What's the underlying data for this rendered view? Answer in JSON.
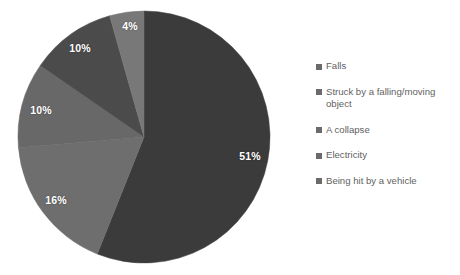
{
  "chart_data": {
    "type": "pie",
    "title": "",
    "subtitle": "",
    "xlabel": "",
    "ylabel": "",
    "grid": false,
    "legend_position": "right",
    "start_angle_deg": 0,
    "direction": "clockwise",
    "categories": [
      "Falls",
      "Struck by a falling/moving object",
      "A collapse",
      "Electricity",
      "Being hit by a vehicle"
    ],
    "values": [
      51,
      16,
      10,
      10,
      4
    ],
    "data_labels": [
      "51%",
      "16%",
      "10%",
      "10%",
      "4%"
    ],
    "slice_colors": [
      "#3b3b3b",
      "#6e6e6e",
      "#686868",
      "#4b4b4b",
      "#787878"
    ],
    "slices": [
      {
        "label": "Falls",
        "value": 51,
        "data_label": "51%",
        "color": "#3b3b3b",
        "label_x": 250,
        "label_y": 156
      },
      {
        "label": "Struck by a falling/moving object",
        "value": 16,
        "data_label": "16%",
        "color": "#6e6e6e",
        "label_x": 56,
        "label_y": 200
      },
      {
        "label": "A collapse",
        "value": 10,
        "data_label": "10%",
        "color": "#686868",
        "label_x": 41,
        "label_y": 110
      },
      {
        "label": "Electricity",
        "value": 10,
        "data_label": "10%",
        "color": "#4b4b4b",
        "label_x": 80,
        "label_y": 48
      },
      {
        "label": "Being hit by a vehicle",
        "value": 4,
        "data_label": "4%",
        "color": "#787878",
        "label_x": 130,
        "label_y": 26
      }
    ],
    "geometry": {
      "center_x": 144,
      "center_y": 137,
      "radius": 126
    }
  },
  "legend": {
    "items": [
      {
        "label": "Falls",
        "color": "#6b6b6b"
      },
      {
        "label": "Struck by a falling/moving object",
        "color": "#6b6b6b"
      },
      {
        "label": "A collapse",
        "color": "#6b6b6b"
      },
      {
        "label": "Electricity",
        "color": "#6b6b6b"
      },
      {
        "label": "Being hit by a vehicle",
        "color": "#6b6b6b"
      }
    ]
  }
}
